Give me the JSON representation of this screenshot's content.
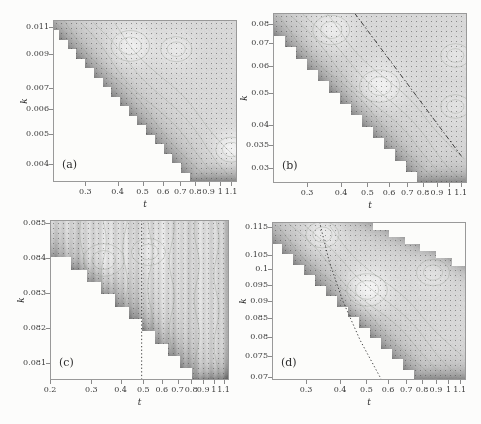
{
  "figure": {
    "name": "two-by-two grayscale contour heatmaps of k versus t with stair-step excluded regions",
    "colors": {
      "page": "#fcfcfb",
      "base_gray": "#d8d8d8",
      "dark_band": "#7d7d7d",
      "frame": "#999999",
      "ink": "#3b3b3b",
      "contour": "#96a096",
      "grid_dot": "#444444",
      "overlay_line": "#323232",
      "excluded_white": "#fcfcfa"
    }
  },
  "chart_data": {
    "type": "heatmap",
    "layout": "2x2 panel grid",
    "panels": [
      {
        "id": "a",
        "corner_label": "(a)",
        "xlabel": "t",
        "ylabel": "k",
        "x_scale": "log",
        "y_scale": "log",
        "x_range": [
          0.225,
          1.16
        ],
        "y_range": [
          0.0035,
          0.0116
        ],
        "x_tick_values": [
          0.3,
          0.4,
          0.5,
          0.6,
          0.7,
          0.8,
          0.9,
          1,
          1.1
        ],
        "x_tick_labels": [
          "0.3",
          "0.4",
          "0.5",
          "0.6",
          "0.7",
          "0.8",
          "0.9",
          "1",
          "1.1"
        ],
        "y_tick_values": [
          0.011,
          0.009,
          0.007,
          0.006,
          0.005,
          0.004
        ],
        "y_tick_labels": [
          "0.011",
          "0.009",
          "0.007",
          "0.006",
          "0.005",
          "0.004"
        ],
        "regions": {
          "lower_left": {
            "left_fy": 0.08,
            "bottom_fx": 0.74,
            "steps": 17,
            "power": 1
          }
        },
        "light_spots": [
          [
            0.42,
            0.16,
            0.11,
            24
          ],
          [
            0.67,
            0.18,
            0.09,
            16
          ],
          [
            0.97,
            0.8,
            0.09,
            30
          ]
        ],
        "overlay_line": null,
        "striations": false
      },
      {
        "id": "b",
        "corner_label": "(b)",
        "xlabel": "t",
        "ylabel": "k",
        "x_scale": "log",
        "y_scale": "log",
        "x_range": [
          0.225,
          1.16
        ],
        "y_range": [
          0.027,
          0.086
        ],
        "x_tick_values": [
          0.3,
          0.4,
          0.5,
          0.6,
          0.7,
          0.8,
          0.9,
          1,
          1.1
        ],
        "x_tick_labels": [
          "0.3",
          "0.4",
          "0.5",
          "0.6",
          "0.7",
          "0.8",
          "0.9",
          "1",
          "1.1"
        ],
        "y_tick_values": [
          0.08,
          0.07,
          0.06,
          0.05,
          0.04,
          0.035,
          0.03
        ],
        "y_tick_labels": [
          "0.08",
          "0.07",
          "0.06",
          "0.05",
          "0.04",
          "0.035",
          "0.03"
        ],
        "regions": {
          "lower_left": {
            "left_fy": 0.13,
            "bottom_fx": 0.74,
            "steps": 15,
            "power": 1
          }
        },
        "light_spots": [
          [
            0.3,
            0.1,
            0.1,
            22
          ],
          [
            0.55,
            0.43,
            0.11,
            28
          ],
          [
            0.94,
            0.25,
            0.08,
            12
          ],
          [
            0.94,
            0.55,
            0.08,
            10
          ]
        ],
        "overlay_line": {
          "style": "dashdot",
          "points": [
            [
              0.42,
              0.0
            ],
            [
              0.97,
              0.84
            ]
          ]
        },
        "striations": false
      },
      {
        "id": "c",
        "corner_label": "(c)",
        "xlabel": "t",
        "ylabel": "k",
        "x_scale": "log",
        "y_scale": "linear",
        "x_range": [
          0.2,
          1.16
        ],
        "y_range": [
          0.0805,
          0.0851
        ],
        "x_tick_values": [
          0.2,
          0.3,
          0.4,
          0.5,
          0.6,
          0.7,
          0.8,
          0.9,
          1,
          1.1
        ],
        "x_tick_labels": [
          "0.2",
          "0.3",
          "0.4",
          "0.5",
          "0.6",
          "0.7",
          "0.8",
          "0.9",
          "1",
          "1.1"
        ],
        "y_tick_values": [
          0.085,
          0.084,
          0.083,
          0.082,
          0.081
        ],
        "y_tick_labels": [
          "0.085",
          "0.084",
          "0.083",
          "0.082",
          "0.081"
        ],
        "regions": {
          "lower_left": {
            "left_fy": 0.23,
            "bottom_fx": 0.79,
            "steps": 13,
            "power": 0.85
          },
          "dark_right_edge": true
        },
        "light_spots": [
          [
            0.3,
            0.25,
            0.12,
            10
          ],
          [
            0.55,
            0.2,
            0.1,
            10
          ]
        ],
        "overlay_line": {
          "style": "dotted",
          "points": [
            [
              0.512,
              0.0
            ],
            [
              0.512,
              1.0
            ]
          ]
        },
        "striations": true
      },
      {
        "id": "d",
        "corner_label": "(d)",
        "xlabel": "t",
        "ylabel": "k",
        "x_scale": "log",
        "y_scale": "log",
        "x_range": [
          0.225,
          1.16
        ],
        "y_range": [
          0.0693,
          0.117
        ],
        "x_tick_values": [
          0.3,
          0.4,
          0.5,
          0.6,
          0.7,
          0.8,
          0.9,
          1,
          1.1
        ],
        "x_tick_labels": [
          "0.3",
          "0.4",
          "0.5",
          "0.6",
          "0.7",
          "0.8",
          "0.9",
          "1",
          "1.1"
        ],
        "y_tick_values": [
          0.115,
          0.105,
          0.1,
          0.095,
          0.09,
          0.085,
          0.08,
          0.075,
          0.07
        ],
        "y_tick_labels": [
          "0.115",
          "0.105",
          "0.1",
          "0.095",
          "0.09",
          "0.085",
          "0.08",
          "0.075",
          "0.07"
        ],
        "regions": {
          "lower_left": {
            "left_fy": 0.14,
            "bottom_fx": 0.73,
            "steps": 15,
            "power": 1
          },
          "upper_right": {
            "top_fx": 0.52,
            "right_fy": 0.27,
            "steps": 22
          }
        },
        "light_spots": [
          [
            0.26,
            0.08,
            0.09,
            24
          ],
          [
            0.49,
            0.43,
            0.11,
            34
          ],
          [
            0.83,
            0.32,
            0.09,
            14
          ]
        ],
        "overlay_line": {
          "style": "dotted",
          "points": [
            [
              0.245,
              0.0
            ],
            [
              0.295,
              0.25
            ],
            [
              0.365,
              0.5
            ],
            [
              0.455,
              0.75
            ],
            [
              0.565,
              1.0
            ]
          ]
        },
        "striations": false
      }
    ]
  }
}
